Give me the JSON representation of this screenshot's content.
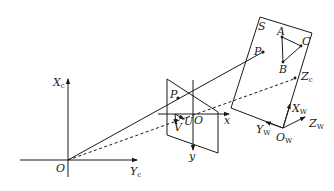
{
  "figure": {
    "type": "camera-projection-geometry"
  },
  "camera_frame": {
    "origin_label": "O",
    "x_axis_label": "X",
    "x_axis_sub": "c",
    "y_axis_label": "Y",
    "y_axis_sub": "c",
    "z_axis_label": "Z",
    "z_axis_sub": "c"
  },
  "image_plane": {
    "origin_label": "O",
    "x_axis_label": "x",
    "y_axis_label": "y",
    "pixel_u_label": "U",
    "pixel_v_label": "V",
    "projected_point_label": "P"
  },
  "object_plane": {
    "label": "S",
    "point_label": "P",
    "triangle": {
      "a": "A",
      "b": "B",
      "c": "C"
    }
  },
  "world_frame": {
    "origin_label": "O",
    "origin_sub": "W",
    "x_axis_label": "X",
    "x_axis_sub": "W",
    "y_axis_label": "Y",
    "y_axis_sub": "W",
    "z_axis_label": "Z",
    "z_axis_sub": "W"
  },
  "colors": {
    "stroke": "#1a1a1a",
    "background": "#ffffff"
  }
}
